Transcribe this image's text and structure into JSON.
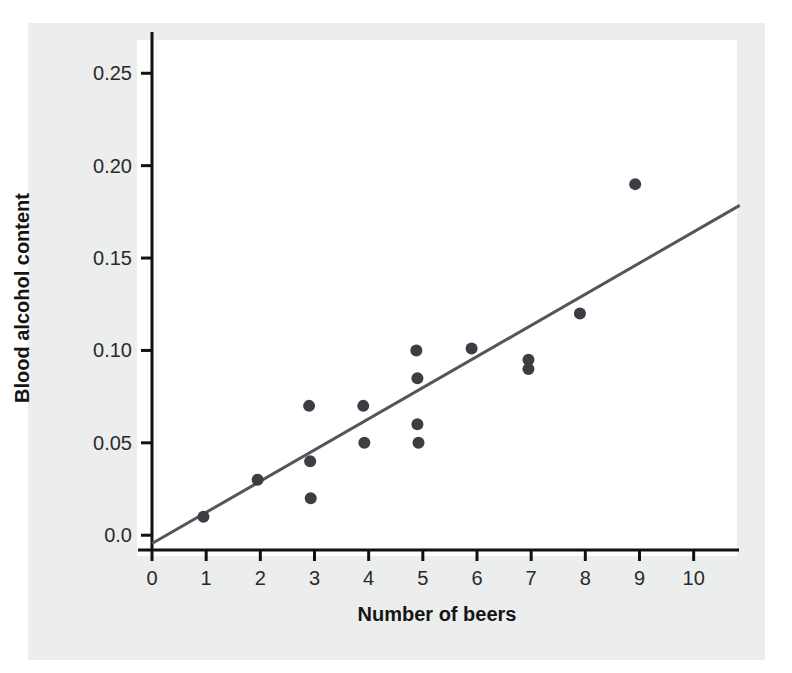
{
  "figure": {
    "background_color": "#ffffff",
    "panel_color": "#eceded",
    "plot_background_color": "#ffffff"
  },
  "chart_data": {
    "type": "scatter",
    "title": "",
    "subtitle": "",
    "xlabel": "Number of beers",
    "ylabel": "Blood alcohol content",
    "xlim": [
      0,
      10.8
    ],
    "ylim": [
      -0.008,
      0.268
    ],
    "xticks": [
      0,
      1,
      2,
      3,
      4,
      5,
      6,
      7,
      8,
      9,
      10
    ],
    "xtick_labels": [
      "0",
      "1",
      "2",
      "3",
      "4",
      "5",
      "6",
      "7",
      "8",
      "9",
      "10"
    ],
    "yticks": [
      0.0,
      0.05,
      0.1,
      0.15,
      0.2,
      0.25
    ],
    "ytick_labels": [
      "0.0",
      "0.05",
      "0.10",
      "0.15",
      "0.20",
      "0.25"
    ],
    "grid": false,
    "legend": null,
    "marker_color": "#3d3d44",
    "marker_size": 9,
    "points": [
      {
        "x": 0.95,
        "y": 0.01
      },
      {
        "x": 1.95,
        "y": 0.03
      },
      {
        "x": 2.9,
        "y": 0.07
      },
      {
        "x": 2.92,
        "y": 0.04
      },
      {
        "x": 2.93,
        "y": 0.02
      },
      {
        "x": 3.9,
        "y": 0.07
      },
      {
        "x": 3.92,
        "y": 0.05
      },
      {
        "x": 4.88,
        "y": 0.1
      },
      {
        "x": 4.9,
        "y": 0.085
      },
      {
        "x": 4.9,
        "y": 0.06
      },
      {
        "x": 4.92,
        "y": 0.05
      },
      {
        "x": 5.9,
        "y": 0.101
      },
      {
        "x": 6.95,
        "y": 0.095
      },
      {
        "x": 6.95,
        "y": 0.09
      },
      {
        "x": 7.9,
        "y": 0.12
      },
      {
        "x": 8.92,
        "y": 0.19
      }
    ],
    "trendline": {
      "type": "linear-regression",
      "color": "#55555d",
      "width": 3,
      "x_start": 0.0,
      "y_start": -0.0045,
      "x_end": 10.85,
      "y_end": 0.1785
    },
    "axis_color": "#111111",
    "axis_width": 3
  },
  "axes": {
    "y_axis_name": "blood-alcohol-content-axis",
    "x_axis_name": "number-of-beers-axis"
  }
}
